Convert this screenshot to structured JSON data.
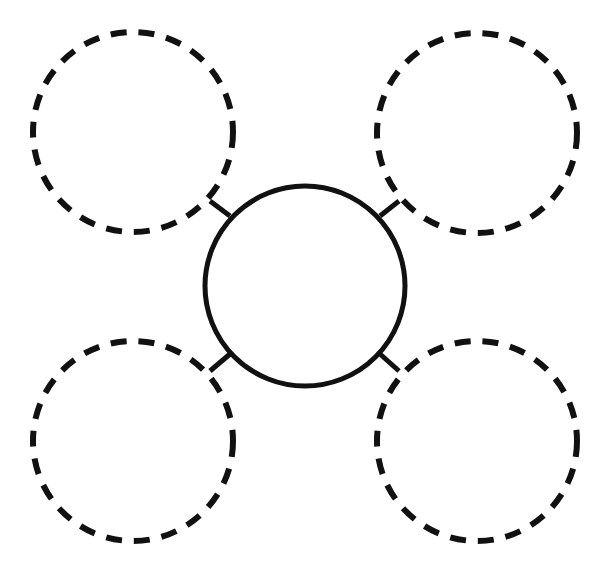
{
  "diagram": {
    "type": "bubble-map",
    "canvas": {
      "width": 598,
      "height": 566,
      "background": "#ffffff"
    },
    "stroke_color": "#111111",
    "center_node": {
      "cx": 305,
      "cy": 286,
      "r": 100,
      "style": "solid",
      "label": ""
    },
    "outer_nodes": [
      {
        "id": "top-left",
        "cx": 133,
        "cy": 132,
        "r": 100,
        "style": "dashed",
        "label": ""
      },
      {
        "id": "top-right",
        "cx": 477,
        "cy": 133,
        "r": 100,
        "style": "dashed",
        "label": ""
      },
      {
        "id": "bottom-left",
        "cx": 133,
        "cy": 441,
        "r": 100,
        "style": "dashed",
        "label": ""
      },
      {
        "id": "bottom-right",
        "cx": 477,
        "cy": 441,
        "r": 100,
        "style": "dashed",
        "label": ""
      }
    ],
    "connectors": [
      {
        "from": "center",
        "to": "top-left",
        "x1": 230,
        "y1": 216,
        "x2": 210,
        "y2": 201
      },
      {
        "from": "center",
        "to": "top-right",
        "x1": 380,
        "y1": 216,
        "x2": 399,
        "y2": 201
      },
      {
        "from": "center",
        "to": "bottom-left",
        "x1": 230,
        "y1": 354,
        "x2": 210,
        "y2": 371
      },
      {
        "from": "center",
        "to": "bottom-right",
        "x1": 380,
        "y1": 354,
        "x2": 399,
        "y2": 371
      }
    ]
  }
}
